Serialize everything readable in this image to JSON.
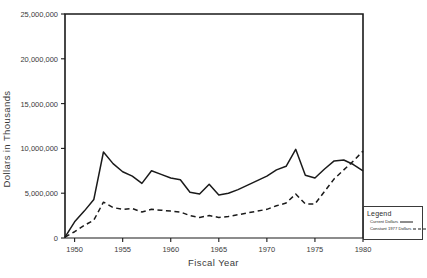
{
  "chart_data": {
    "type": "line",
    "title": "",
    "xlabel": "Fiscal Year",
    "ylabel": "Dollars in Thousands",
    "xlim": [
      1949,
      1980
    ],
    "ylim": [
      0,
      25000000
    ],
    "grid": false,
    "legend_position": "bottom-right-outside",
    "xticks": [
      1950,
      1955,
      1960,
      1965,
      1970,
      1975,
      1980
    ],
    "xtick_labels": [
      "1950",
      "1955",
      "1960",
      "1965",
      "1970",
      "1975",
      "1980"
    ],
    "yticks": [
      0,
      5000000,
      10000000,
      15000000,
      20000000,
      25000000
    ],
    "ytick_labels": [
      "0",
      "5,000,000",
      "10,000,000",
      "15,000,000",
      "20,000,000",
      "25,000,000"
    ],
    "x": [
      1949,
      1950,
      1951,
      1952,
      1953,
      1954,
      1955,
      1956,
      1957,
      1958,
      1959,
      1960,
      1961,
      1962,
      1963,
      1964,
      1965,
      1966,
      1967,
      1968,
      1969,
      1970,
      1971,
      1972,
      1973,
      1974,
      1975,
      1976,
      1977,
      1978,
      1979,
      1980
    ],
    "series": [
      {
        "name": "Current Dollars",
        "style": "solid",
        "color": "#1a1a1a",
        "values": [
          100000,
          1800000,
          3000000,
          4300000,
          9600000,
          8300000,
          7400000,
          6900000,
          6100000,
          7500000,
          7100000,
          6700000,
          6500000,
          5100000,
          4900000,
          6000000,
          4800000,
          5000000,
          5400000,
          5900000,
          6400000,
          6900000,
          7600000,
          8000000,
          9900000,
          7000000,
          6700000,
          7700000,
          8600000,
          8700000,
          8200000,
          7500000
        ]
      },
      {
        "name": "Constant 1977 Dollars",
        "style": "dashed",
        "color": "#1a1a1a",
        "values": [
          100000,
          700000,
          1400000,
          2000000,
          4000000,
          3400000,
          3200000,
          3300000,
          2900000,
          3200000,
          3100000,
          3000000,
          2900000,
          2500000,
          2300000,
          2500000,
          2300000,
          2400000,
          2600000,
          2800000,
          3000000,
          3200000,
          3600000,
          3900000,
          4900000,
          3800000,
          3800000,
          5200000,
          6600000,
          7600000,
          8600000,
          9700000
        ]
      }
    ]
  },
  "legend": {
    "title": "Legend",
    "entries": [
      {
        "label": "Current Dollars",
        "style": "solid"
      },
      {
        "label": "Constant 1977 Dollars",
        "style": "dashed"
      }
    ]
  }
}
